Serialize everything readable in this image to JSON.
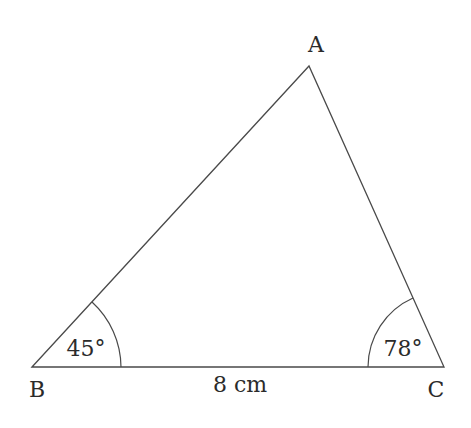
{
  "diagram": {
    "type": "triangle",
    "vertices": {
      "A": {
        "label": "A"
      },
      "B": {
        "label": "B"
      },
      "C": {
        "label": "C"
      }
    },
    "angles": {
      "B": {
        "label": "45°"
      },
      "C": {
        "label": "78°"
      }
    },
    "sides": {
      "BC": {
        "label": "8 cm"
      }
    },
    "colors": {
      "line": "#4a4a4a",
      "text": "#2b2b2b",
      "background": "#ffffff"
    }
  }
}
